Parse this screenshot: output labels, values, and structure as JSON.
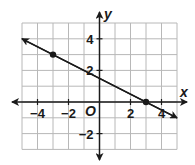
{
  "chart_data": {
    "type": "line",
    "title": "",
    "xlabel": "x",
    "ylabel": "y",
    "origin_label": "O",
    "xlim": [
      -5,
      5
    ],
    "ylim": [
      -3,
      5
    ],
    "grid": true,
    "x_tick_labels": [
      "−4",
      "−2",
      "2",
      "4"
    ],
    "x_tick_values": [
      -4,
      -2,
      2,
      4
    ],
    "y_tick_labels": [
      "4",
      "2",
      "−2"
    ],
    "y_tick_values": [
      4,
      2,
      -2
    ],
    "series": [
      {
        "name": "line",
        "equation": "y = -0.5x + 1.5",
        "x": [
          -5,
          5
        ],
        "y": [
          4,
          -1
        ],
        "marked_points": [
          {
            "x": -3,
            "y": 3
          },
          {
            "x": 3,
            "y": 0
          }
        ]
      }
    ],
    "colors": {
      "grid": "#b8b8b8",
      "axes": "#1a1a1a",
      "line": "#1a1a1a"
    }
  }
}
